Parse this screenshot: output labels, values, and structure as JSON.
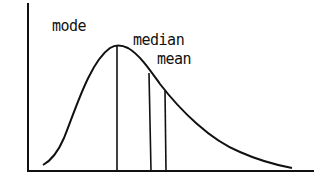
{
  "diagram": {
    "labels": {
      "mode": "mode",
      "median": "median",
      "mean": "mean"
    },
    "colors": {
      "line": "#111111",
      "background": "#ffffff"
    }
  }
}
